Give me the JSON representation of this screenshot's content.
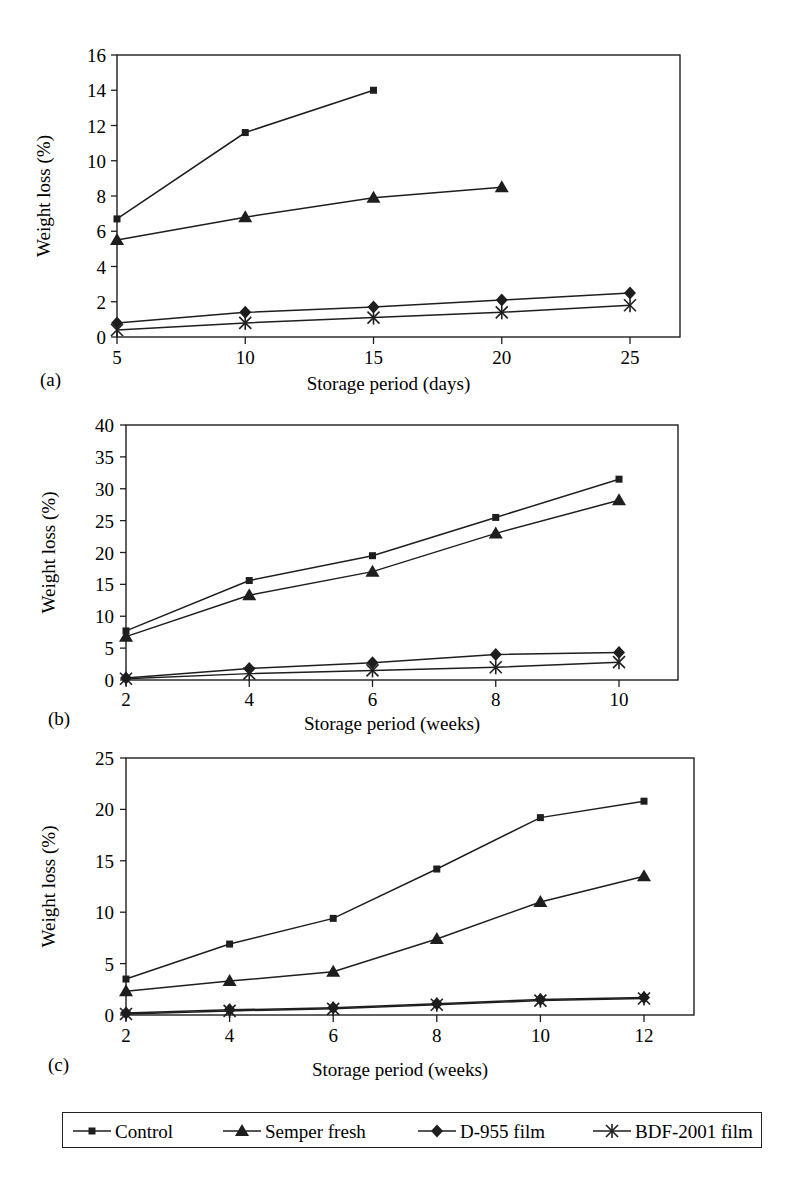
{
  "legend": [
    {
      "name": "Control",
      "marker": "square"
    },
    {
      "name": "Semper fresh",
      "marker": "triangle"
    },
    {
      "name": "D-955 film",
      "marker": "diamond"
    },
    {
      "name": "BDF-2001 film",
      "marker": "asterisk"
    }
  ],
  "chart_data": [
    {
      "panel": "(a)",
      "type": "line",
      "title": "",
      "xlabel": "Storage period (days)",
      "ylabel": "Weight loss (%)",
      "x": [
        5,
        10,
        15,
        20,
        25
      ],
      "xticks": [
        "5",
        "10",
        "15",
        "20",
        "25"
      ],
      "yticks": [
        "0",
        "2",
        "4",
        "6",
        "8",
        "10",
        "12",
        "14",
        "16"
      ],
      "ylim": [
        0,
        16
      ],
      "grid": false,
      "series": [
        {
          "name": "Control",
          "values": [
            6.7,
            11.6,
            14.0,
            null,
            null
          ]
        },
        {
          "name": "Semper fresh",
          "values": [
            5.5,
            6.8,
            7.9,
            8.5,
            null
          ]
        },
        {
          "name": "D-955 film",
          "values": [
            0.8,
            1.4,
            1.7,
            2.1,
            2.5
          ]
        },
        {
          "name": "BDF-2001 film",
          "values": [
            0.4,
            0.8,
            1.1,
            1.4,
            1.8
          ]
        }
      ]
    },
    {
      "panel": "(b)",
      "type": "line",
      "title": "",
      "xlabel": "Storage period (weeks)",
      "ylabel": "Weight loss (%)",
      "x": [
        2,
        4,
        6,
        8,
        10
      ],
      "xticks": [
        "2",
        "4",
        "6",
        "8",
        "10"
      ],
      "yticks": [
        "0",
        "5",
        "10",
        "15",
        "20",
        "25",
        "30",
        "35",
        "40"
      ],
      "ylim": [
        0,
        40
      ],
      "grid": false,
      "series": [
        {
          "name": "Control",
          "values": [
            7.7,
            15.6,
            19.5,
            25.5,
            31.5
          ]
        },
        {
          "name": "Semper fresh",
          "values": [
            6.8,
            13.3,
            17.0,
            23.0,
            28.2
          ]
        },
        {
          "name": "D-955 film",
          "values": [
            0.3,
            1.8,
            2.7,
            4.0,
            4.3
          ]
        },
        {
          "name": "BDF-2001 film",
          "values": [
            0.2,
            1.0,
            1.5,
            2.0,
            2.8
          ]
        }
      ]
    },
    {
      "panel": "(c)",
      "type": "line",
      "title": "",
      "xlabel": "Storage period (weeks)",
      "ylabel": "Weight loss (%)",
      "x": [
        2,
        4,
        6,
        8,
        10,
        12
      ],
      "xticks": [
        "2",
        "4",
        "6",
        "8",
        "10",
        "12"
      ],
      "yticks": [
        "0",
        "5",
        "10",
        "15",
        "20",
        "25"
      ],
      "ylim": [
        0,
        25
      ],
      "grid": false,
      "series": [
        {
          "name": "Control",
          "values": [
            3.5,
            6.9,
            9.4,
            14.2,
            19.2,
            20.8
          ]
        },
        {
          "name": "Semper fresh",
          "values": [
            2.3,
            3.3,
            4.2,
            7.4,
            11.0,
            13.5
          ]
        },
        {
          "name": "D-955 film",
          "values": [
            0.2,
            0.5,
            0.7,
            1.1,
            1.5,
            1.7
          ]
        },
        {
          "name": "BDF-2001 film",
          "values": [
            0.1,
            0.4,
            0.6,
            1.0,
            1.4,
            1.6
          ]
        }
      ]
    }
  ]
}
